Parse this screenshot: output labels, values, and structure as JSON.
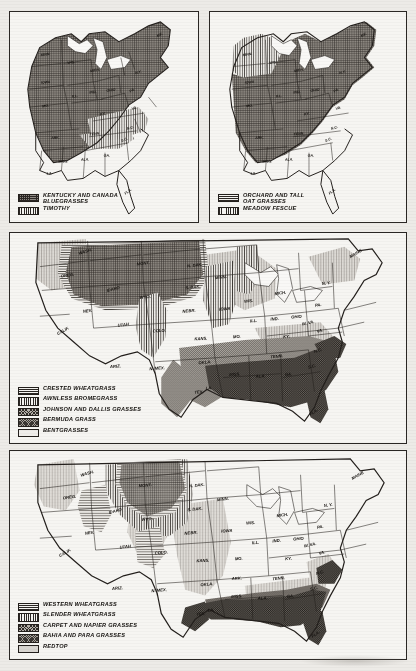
{
  "document": {
    "kind": "scanned-figure-page",
    "description": "Four United States maps showing distribution of cultivated forage grasses"
  },
  "maps": [
    {
      "id": "map-1",
      "region": "eastern-united-states",
      "legend": [
        {
          "pattern": "cross-hatch-dark",
          "label": "KENTUCKY AND CANADA\nBLUEGRASSES"
        },
        {
          "pattern": "vertical-lines",
          "label": "TIMOTHY"
        }
      ],
      "state_labels": [
        "MINN.",
        "WIS.",
        "MICH.",
        "IOWA",
        "ILL.",
        "IND.",
        "OHIO",
        "MO.",
        "KY.",
        "TENN.",
        "ARK.",
        "MISS.",
        "ALA.",
        "GA.",
        "FLA.",
        "LA.",
        "S.C.",
        "N.C.",
        "VA.",
        "W.VA.",
        "PA.",
        "N.Y.",
        "MAINE",
        "VT.",
        "N.H.",
        "MASS.",
        "CONN.",
        "R.I.",
        "N.J.",
        "DEL.",
        "MD."
      ]
    },
    {
      "id": "map-2",
      "region": "eastern-united-states",
      "legend": [
        {
          "pattern": "horizontal-lines",
          "label": "ORCHARD AND TALL\nOAT GRASSES"
        },
        {
          "pattern": "vertical-lines",
          "label": "MEADOW FESCUE"
        }
      ],
      "state_labels": [
        "MINN.",
        "WIS.",
        "MICH.",
        "IOWA",
        "ILL.",
        "IND.",
        "OHIO",
        "MO.",
        "KY.",
        "TENN.",
        "ARK.",
        "MISS.",
        "ALA.",
        "GA.",
        "FLA.",
        "LA.",
        "S.C.",
        "N.C.",
        "VA.",
        "W.VA.",
        "PA.",
        "N.Y.",
        "MAINE",
        "VT.",
        "N.H.",
        "MASS.",
        "CONN.",
        "R.I.",
        "N.J.",
        "DEL.",
        "MD."
      ]
    },
    {
      "id": "map-3",
      "region": "conterminous-united-states",
      "legend": [
        {
          "pattern": "horizontal-lines",
          "label": "CRESTED WHEATGRASS"
        },
        {
          "pattern": "vertical-lines",
          "label": "AWNLESS BROMEGRASS"
        },
        {
          "pattern": "stipple-dark",
          "label": "JOHNSON AND DALLIS GRASSES"
        },
        {
          "pattern": "solid-mid-gray",
          "label": "BERMUDA GRASS"
        },
        {
          "pattern": "plain-light",
          "label": "BENTGRASSES"
        }
      ],
      "state_labels": [
        "WASH.",
        "OREG.",
        "IDAHO",
        "MONT.",
        "N. DAK.",
        "S. DAK.",
        "WYO.",
        "NEBR.",
        "COLO.",
        "KANS.",
        "UTAH",
        "NEV.",
        "CALIF.",
        "ARIZ.",
        "N. MEX.",
        "OKLA.",
        "TEX.",
        "MINN.",
        "IOWA",
        "MO.",
        "ARK.",
        "LA.",
        "WIS.",
        "ILL.",
        "MICH.",
        "IND.",
        "OHIO",
        "KY.",
        "TENN.",
        "MISS.",
        "ALA.",
        "GA.",
        "FLA.",
        "S.C.",
        "N.C.",
        "VA.",
        "W. VA.",
        "PA.",
        "N.Y.",
        "MAINE",
        "VT.",
        "N.H.",
        "MASS.",
        "CONN.",
        "R.I.",
        "N.J.",
        "DEL.",
        "MD."
      ]
    },
    {
      "id": "map-4",
      "region": "conterminous-united-states",
      "legend": [
        {
          "pattern": "horizontal-lines",
          "label": "WESTERN WHEATGRASS"
        },
        {
          "pattern": "vertical-lines",
          "label": "SLENDER WHEATGRASS"
        },
        {
          "pattern": "stipple-dark",
          "label": "CARPET AND NAPIER GRASSES"
        },
        {
          "pattern": "solid-mid-gray",
          "label": "BAHIA AND PARA GRASSES"
        },
        {
          "pattern": "plain-light",
          "label": "REDTOP"
        }
      ],
      "state_labels": [
        "WASH.",
        "OREG.",
        "IDAHO",
        "MONT.",
        "N. DAK.",
        "S. DAK.",
        "WYO.",
        "NEBR.",
        "COLO.",
        "KANS.",
        "UTAH",
        "NEV.",
        "CALIF.",
        "ARIZ.",
        "N. MEX.",
        "OKLA.",
        "TEX.",
        "MINN.",
        "IOWA",
        "MO.",
        "ARK.",
        "LA.",
        "WIS.",
        "ILL.",
        "MICH.",
        "IND.",
        "OHIO",
        "KY.",
        "TENN.",
        "MISS.",
        "ALA.",
        "GA.",
        "FLA.",
        "S.C.",
        "N.C.",
        "VA.",
        "W. VA.",
        "PA.",
        "N.Y.",
        "MAINE",
        "VT.",
        "N.H.",
        "MASS.",
        "CONN.",
        "R.I.",
        "N.J.",
        "DEL.",
        "MD."
      ]
    }
  ],
  "colors": {
    "paper": "#edebe7",
    "panel": "#f6f5f2",
    "ink": "#231f1c",
    "shade_dark": "#56514b",
    "shade_mid": "#8b867f",
    "shade_light": "#cfccc6"
  }
}
